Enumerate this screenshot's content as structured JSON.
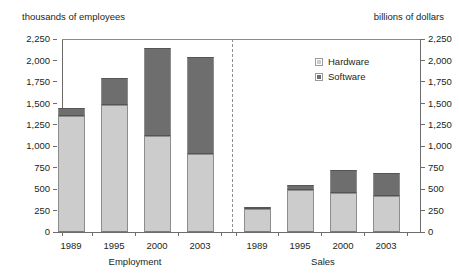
{
  "axis_titles": {
    "left": "thousands of employees",
    "right": "billions of dollars"
  },
  "legend": {
    "position": "inside-top-right",
    "entries": [
      {
        "label": "Hardware",
        "color": "#cccccc",
        "icon": "legend-swatch-icon"
      },
      {
        "label": "Software",
        "color": "#6e6e6e",
        "icon": "legend-swatch-icon"
      }
    ]
  },
  "y_axis": {
    "ticks": [
      "2,250",
      "2,000",
      "1,750",
      "1,500",
      "1,250",
      "1,000",
      "750",
      "500",
      "250",
      "0"
    ],
    "tick_values": [
      2250,
      2000,
      1750,
      1500,
      1250,
      1000,
      750,
      500,
      250,
      0
    ],
    "min": 0,
    "max": 2250
  },
  "groups": [
    {
      "name": "Employment",
      "categories": [
        "1989",
        "1995",
        "2000",
        "2003"
      ]
    },
    {
      "name": "Sales",
      "categories": [
        "1989",
        "1995",
        "2000",
        "2003"
      ]
    }
  ],
  "chart_data": {
    "type": "bar",
    "subtype": "stacked-grouped",
    "title": "",
    "subtitle": "",
    "xlabel": "",
    "ylabel": "thousands of employees",
    "y2label": "billions of dollars",
    "ylim": [
      0,
      2250
    ],
    "y2lim": [
      0,
      2250
    ],
    "ytick_step": 250,
    "grid": false,
    "legend": [
      "Hardware",
      "Software"
    ],
    "legend_position": "inside-top-right",
    "group_divider": true,
    "groups": [
      "Employment",
      "Sales"
    ],
    "categories": [
      "1989",
      "1995",
      "2000",
      "2003"
    ],
    "panels": [
      {
        "group": "Employment",
        "unit": "thousands of employees",
        "categories": [
          "1989",
          "1995",
          "2000",
          "2003"
        ],
        "series": [
          {
            "name": "Hardware",
            "color": "#cccccc",
            "values": [
              1350,
              1475,
              1120,
              910
            ]
          },
          {
            "name": "Software",
            "color": "#6e6e6e",
            "values": [
              100,
              315,
              1020,
              1130
            ]
          }
        ],
        "totals": [
          1450,
          1790,
          2140,
          2040
        ]
      },
      {
        "group": "Sales",
        "unit": "billions of dollars",
        "categories": [
          "1989",
          "1995",
          "2000",
          "2003"
        ],
        "series": [
          {
            "name": "Hardware",
            "color": "#cccccc",
            "values": [
              280,
              490,
              455,
              420
            ]
          },
          {
            "name": "Software",
            "color": "#6e6e6e",
            "values": [
              10,
              60,
              270,
              270
            ]
          }
        ],
        "totals": [
          290,
          550,
          725,
          690
        ]
      }
    ]
  },
  "colors": {
    "hardware": "#cccccc",
    "software": "#6e6e6e",
    "axis": "#6d6d6d",
    "text": "#231f20",
    "divider": "#8f8f8f",
    "background": "#ffffff"
  }
}
